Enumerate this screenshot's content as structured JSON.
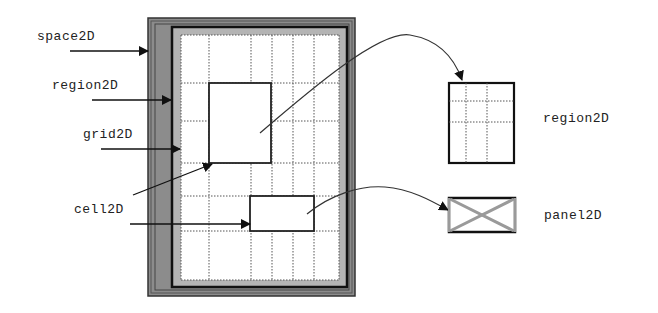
{
  "diagram": {
    "type": "component-hierarchy",
    "labels": {
      "space2d": "space2D",
      "region2d_left": "region2D",
      "grid2d": "grid2D",
      "cell2d": "cell2D",
      "region2d_right": "region2D",
      "panel2d": "panel2D"
    },
    "colors": {
      "space_band": "#8c8c8c",
      "region_band": "#b4b4b4",
      "frame": "#1a1a1a",
      "grid_line": "#555555",
      "panel_cross": "#9a9a9a",
      "background": "#ffffff"
    },
    "nodes": [
      {
        "id": "space2D",
        "desc": "outer dark gray container"
      },
      {
        "id": "region2D",
        "desc": "black-framed area with light gray band"
      },
      {
        "id": "grid2D",
        "desc": "dotted grid 6 cols x 6 rows"
      },
      {
        "id": "cell2D",
        "desc": "individual grid cells (highlighted rectangles)"
      },
      {
        "id": "region2D_detail",
        "desc": "extracted region drawn as 3x3 grid"
      },
      {
        "id": "panel2D",
        "desc": "extracted cell drawn as box with X"
      }
    ],
    "edges": [
      {
        "from": "space2D label",
        "to": "space2D"
      },
      {
        "from": "region2D label",
        "to": "region2D"
      },
      {
        "from": "grid2D label",
        "to": "grid2D"
      },
      {
        "from": "cell2D label",
        "to": "cell2D (large)"
      },
      {
        "from": "cell2D label",
        "to": "cell2D (small)"
      },
      {
        "from": "large cell",
        "to": "region2D detail",
        "style": "curved"
      },
      {
        "from": "small cell",
        "to": "panel2D",
        "style": "curved"
      }
    ]
  }
}
